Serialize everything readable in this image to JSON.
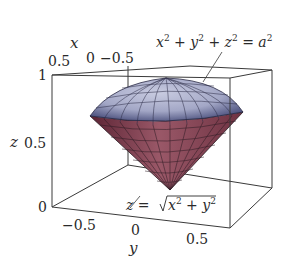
{
  "figure": {
    "type": "3d-surface-plot"
  },
  "axes": {
    "x": {
      "label": "x",
      "ticks": [
        "0.5",
        "0",
        "−0.5"
      ]
    },
    "y": {
      "label": "y",
      "ticks": [
        "−0.5",
        "0",
        "0.5"
      ]
    },
    "z": {
      "label": "z",
      "ticks": [
        "0",
        "0.5",
        "1"
      ]
    }
  },
  "annotations": {
    "sphere": {
      "text_parts": [
        "x",
        "2",
        " + ",
        "y",
        "2",
        " + ",
        "z",
        "2",
        " = ",
        "a",
        "2"
      ]
    },
    "cone": {
      "lhs": "z = ",
      "radicand": [
        "x",
        "2",
        " + ",
        "y",
        "2"
      ]
    }
  },
  "colors": {
    "sphere_fill": "#a9adc9",
    "sphere_shade": "#4a4f7c",
    "cone_fill": "#8a4a5a",
    "cone_shade": "#5a2333",
    "grid_line": "#2a2030",
    "box_line": "#3a3a3a"
  }
}
